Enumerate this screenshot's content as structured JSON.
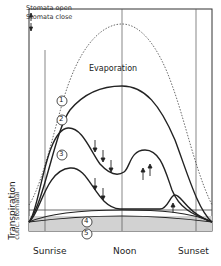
{
  "legend": {
    "open": "Stomata open",
    "close": "Stomata close"
  },
  "labels": {
    "evaporation": "Evaporation",
    "y_axis": "Transpiration",
    "y_axis_sub": "cutic. stomatal",
    "x_ticks": [
      "Sunrise",
      "Noon",
      "Sunset"
    ]
  },
  "curves": [
    {
      "id": "1",
      "label": "1"
    },
    {
      "id": "2",
      "label": "2"
    },
    {
      "id": "3",
      "label": "3"
    },
    {
      "id": "4",
      "label": "4"
    },
    {
      "id": "5",
      "label": "5"
    }
  ],
  "colors": {
    "line": "#222222",
    "band": "#cfcfcf",
    "dotted": "#444444"
  }
}
